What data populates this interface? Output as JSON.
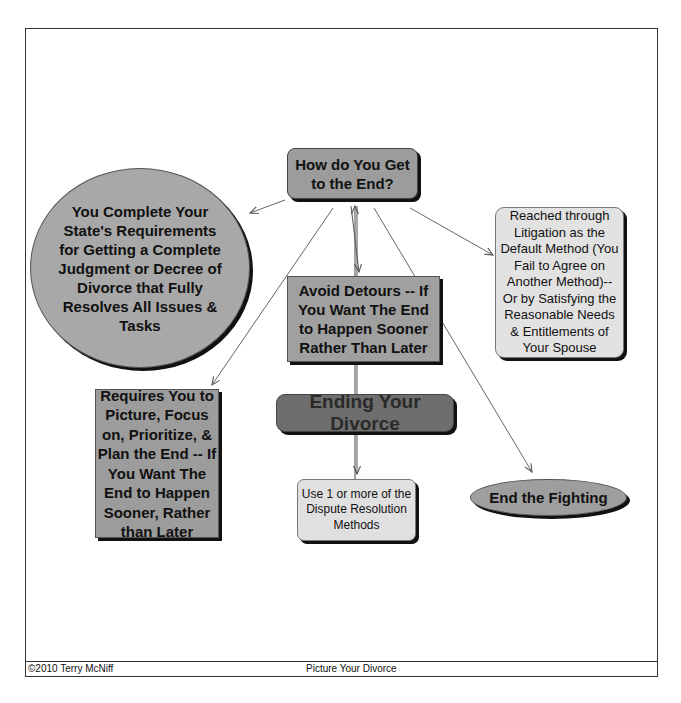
{
  "diagram": {
    "nodes": {
      "center_question": "How do You Get to the End?",
      "state_requirements": "You Complete Your State's Requirements for Getting a Complete Judgment or Decree of Divorce that Fully Resolves All Issues & Tasks",
      "litigation_default": "Reached through Litigation as the Default Method (You Fail to Agree on Another Method)-- Or by Satisfying the Reasonable Needs & Entitlements of Your Spouse",
      "avoid_detours": "Avoid Detours -- If You Want The End to Happen Sooner Rather Than Later",
      "requires_picture": "Requires You to Picture, Focus on, Prioritize, & Plan the End -- If You Want The End to Happen Sooner, Rather than Later",
      "ending_title": "Ending Your Divorce",
      "dispute_methods": "Use 1 or more of the Dispute Resolution Methods",
      "end_fighting": "End the Fighting"
    },
    "edges": [
      {
        "from": "center_question",
        "to": "state_requirements"
      },
      {
        "from": "center_question",
        "to": "litigation_default"
      },
      {
        "from": "center_question",
        "to": "requires_picture"
      },
      {
        "from": "center_question",
        "to": "avoid_detours"
      },
      {
        "from": "avoid_detours",
        "to": "center_question"
      },
      {
        "from": "center_question",
        "to": "dispute_methods"
      },
      {
        "from": "center_question",
        "to": "end_fighting"
      }
    ]
  },
  "footer": {
    "copyright": "©2010 Terry McNiff",
    "title": "Picture Your Divorce"
  }
}
